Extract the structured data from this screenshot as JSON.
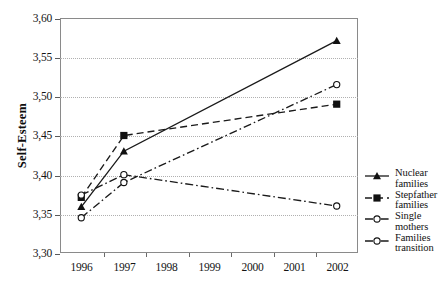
{
  "chart_data": {
    "type": "line",
    "title": "",
    "xlabel": "",
    "ylabel": "Self-Esteem",
    "x": [
      1996,
      1997,
      1998,
      1999,
      2000,
      2001,
      2002
    ],
    "categories": [
      "1996",
      "1997",
      "1998",
      "1999",
      "2000",
      "2001",
      "2002"
    ],
    "ylim": [
      3.3,
      3.6
    ],
    "ytick_labels": [
      "3,60",
      "3,55",
      "3,50",
      "3,45",
      "3,40",
      "3,35",
      "3,30"
    ],
    "ytick_values": [
      3.6,
      3.55,
      3.5,
      3.45,
      3.4,
      3.35,
      3.3
    ],
    "grid": "horizontal-dotted",
    "legend_position": "right",
    "decimal_separator": ",",
    "series": [
      {
        "name": "Nuclear\nfamilies",
        "label_line1": "Nuclear",
        "label_line2": "families",
        "marker": "filled-triangle",
        "linestyle": "solid",
        "color": "#1a1a1a",
        "x": [
          1996,
          1997,
          2002
        ],
        "values": [
          3.359,
          3.43,
          3.571
        ]
      },
      {
        "name": "Stepfather\nfamilies",
        "label_line1": "Stepfather",
        "label_line2": "families",
        "marker": "filled-square",
        "linestyle": "dashed",
        "color": "#1a1a1a",
        "x": [
          1996,
          1997,
          2002
        ],
        "values": [
          3.371,
          3.45,
          3.49
        ]
      },
      {
        "name": "Single\nmothers",
        "label_line1": "Single",
        "label_line2": "mothers",
        "marker": "open-circle",
        "linestyle": "dash-dot",
        "color": "#1a1a1a",
        "x": [
          1996,
          1997,
          2002
        ],
        "values": [
          3.345,
          3.39,
          3.515
        ]
      },
      {
        "name": "Families\ntransition",
        "label_line1": "Families",
        "label_line2": "transition",
        "marker": "open-circle",
        "linestyle": "dash-dot",
        "color": "#1a1a1a",
        "x": [
          1996,
          1997,
          2002
        ],
        "values": [
          3.374,
          3.4,
          3.36
        ]
      }
    ]
  },
  "axis": {
    "y_title": "Self-Esteem"
  },
  "legend": {
    "items": [
      {
        "label_line1": "Nuclear",
        "label_line2": "families"
      },
      {
        "label_line1": "Stepfather",
        "label_line2": "families"
      },
      {
        "label_line1": "Single",
        "label_line2": "mothers"
      },
      {
        "label_line1": "Families",
        "label_line2": "transition"
      }
    ]
  }
}
